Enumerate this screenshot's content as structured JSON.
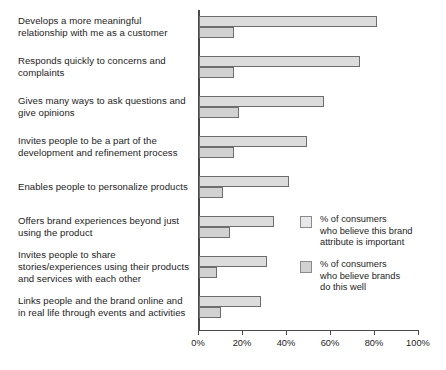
{
  "chart_data": {
    "type": "bar",
    "orientation": "horizontal",
    "title": "",
    "xlabel": "",
    "ylabel": "",
    "xlim": [
      0,
      100
    ],
    "xticks": [
      "0%",
      "20%",
      "40%",
      "60%",
      "80%",
      "100%"
    ],
    "xtick_values": [
      0,
      20,
      40,
      60,
      80,
      100
    ],
    "grid": false,
    "legend_position": "right-middle",
    "categories": [
      "Develops a more meaningful\nrelationship with me as a customer",
      "Responds quickly to concerns and\ncomplaints",
      "Gives many ways to ask questions and\ngive opinions",
      "Invites people to be a part of the\ndevelopment and refinement process",
      "Enables people to personalize products",
      "Offers brand experiences beyond just\nusing the product",
      "Invites people to share\nstories/experiences using their products\nand services with each other",
      "Links people and the brand online and\nin real life through events and activities"
    ],
    "series": [
      {
        "name": "% of consumers\nwho believe this brand\nattribute is important",
        "key": "important",
        "color": "#dcdcdc",
        "values": [
          81,
          73,
          57,
          49,
          41,
          34,
          31,
          28
        ]
      },
      {
        "name": "% of consumers\nwho believe brands\ndo this well",
        "key": "dothiswell",
        "color": "#d2d2d2",
        "values": [
          16,
          16,
          18,
          16,
          11,
          14,
          8,
          10
        ]
      }
    ]
  }
}
